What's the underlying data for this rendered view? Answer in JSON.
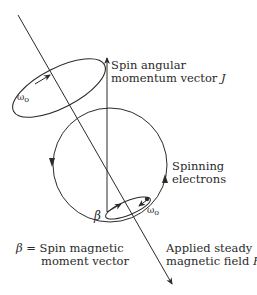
{
  "diagram": {
    "labels": {
      "spin_angular_line1": "Spin angular",
      "spin_angular_line2": "momentum vector ",
      "spin_angular_symbol": "J",
      "spinning_line1": "Spinning",
      "spinning_line2": "electrons",
      "applied_line1": "Applied steady",
      "applied_line2": "magnetic field ",
      "applied_symbol": "H",
      "applied_subscript": "o",
      "beta_symbol": "β",
      "beta_def_symbol": "β",
      "beta_def_eq": " = ",
      "beta_def_line1": "Spin magnetic",
      "beta_def_line2": "moment vector",
      "omega_upper": "ω",
      "omega_upper_sub": "o",
      "omega_lower": "ω",
      "omega_lower_sub": "o"
    },
    "colors": {
      "stroke": "#2a2a2a",
      "background": "#ffffff"
    }
  }
}
